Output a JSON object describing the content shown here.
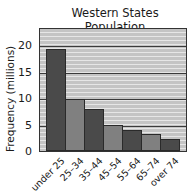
{
  "chart_data": {
    "type": "bar",
    "title": "Western States Population",
    "xlabel": "",
    "ylabel": "Frequency (millions)",
    "categories": [
      "under 25",
      "25–34",
      "35–44",
      "45–54",
      "55–64",
      "65–74",
      "over 74"
    ],
    "values": [
      19.4,
      9.8,
      8.0,
      5.0,
      4.0,
      3.3,
      2.2
    ],
    "ylim": [
      0,
      23.5
    ],
    "yticks": [
      0,
      5,
      10,
      15,
      20
    ],
    "grid": true,
    "legend": null,
    "colors": [
      "#4a4a4a",
      "#808080",
      "#4a4a4a",
      "#808080",
      "#4a4a4a",
      "#808080",
      "#4a4a4a"
    ]
  },
  "labels": {
    "title": "Western States Population",
    "ylabel": "Frequency (millions)",
    "yticks": [
      "0",
      "5",
      "10",
      "15",
      "20"
    ],
    "categories": [
      "under 25",
      "25–34",
      "35–44",
      "45–54",
      "55–64",
      "65–74",
      "over 74"
    ]
  }
}
